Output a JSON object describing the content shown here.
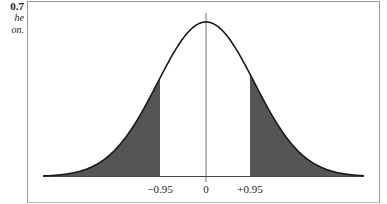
{
  "caption": {
    "number": "0.7",
    "lines": [
      "he",
      "on."
    ]
  },
  "chart_data": {
    "type": "area",
    "title": "",
    "xlabel": "",
    "ylabel": "",
    "tick_labels": [
      "−0.95",
      "0",
      "+0.95"
    ],
    "tick_values": [
      -0.95,
      0,
      0.95
    ],
    "shaded_regions": [
      {
        "from": "-inf",
        "to": -0.95,
        "label": "left tail"
      },
      {
        "from": 0.95,
        "to": "inf",
        "label": "right tail"
      }
    ],
    "center_line": 0,
    "curve": "normal (mean 0)",
    "grid": false,
    "legend": "none",
    "colors": {
      "shade": "#555555",
      "curve": "#1a1a1a",
      "axis": "#444444",
      "center_line": "#777777"
    }
  }
}
